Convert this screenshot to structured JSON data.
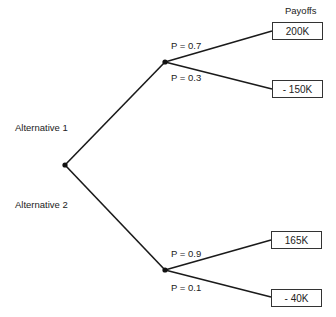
{
  "header": {
    "payoffs_label": "Payoffs"
  },
  "alternatives": [
    {
      "label": "Alternative 1",
      "branches": [
        {
          "probability": "P = 0.7",
          "payoff": "200K"
        },
        {
          "probability": "P = 0.3",
          "payoff": "- 150K"
        }
      ]
    },
    {
      "label": "Alternative 2",
      "branches": [
        {
          "probability": "P = 0.9",
          "payoff": "165K"
        },
        {
          "probability": "P = 0.1",
          "payoff": "- 40K"
        }
      ]
    }
  ],
  "colors": {
    "line": "#1a1a1a",
    "box_border": "#333333",
    "background": "#ffffff"
  }
}
